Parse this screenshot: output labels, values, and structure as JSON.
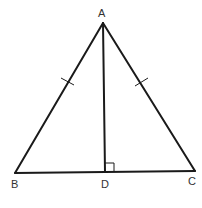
{
  "diagram": {
    "type": "geometry",
    "points": {
      "A": {
        "label": "A",
        "x": 103,
        "y": 23,
        "label_x": 102,
        "label_y": 17
      },
      "B": {
        "label": "B",
        "x": 15,
        "y": 173,
        "label_x": 15,
        "label_y": 188
      },
      "C": {
        "label": "C",
        "x": 195,
        "y": 171,
        "label_x": 192,
        "label_y": 185
      },
      "D": {
        "label": "D",
        "x": 105,
        "y": 172,
        "label_x": 105,
        "label_y": 188
      }
    },
    "segments": [
      "AB",
      "AC",
      "BC",
      "AD"
    ],
    "congruence_marks": [
      "AB",
      "AC"
    ],
    "right_angle_at": "D",
    "stroke_color": "#1a1a1a",
    "label_color": "#333333"
  }
}
